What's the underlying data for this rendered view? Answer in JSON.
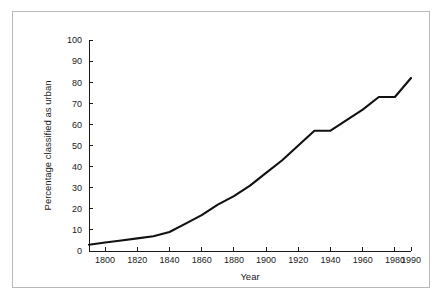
{
  "figure": {
    "frame_color": "#b9b9b9",
    "background": "#ffffff"
  },
  "chart_data": {
    "type": "line",
    "title": "",
    "xlabel": "Year",
    "ylabel": "Percentage classified as urban",
    "xlim": [
      1790,
      1990
    ],
    "ylim": [
      0,
      100
    ],
    "grid": false,
    "legend": null,
    "line_color": "#111111",
    "xticks": [
      1800,
      1820,
      1840,
      1860,
      1880,
      1900,
      1920,
      1940,
      1960,
      1980,
      1990
    ],
    "xtick_labels": [
      "1800",
      "1820",
      "1840",
      "1860",
      "1880",
      "1900",
      "1920",
      "1940",
      "1960",
      "1980",
      "1990"
    ],
    "yticks": [
      0,
      10,
      20,
      30,
      40,
      50,
      60,
      70,
      80,
      90,
      100
    ],
    "ytick_labels": [
      "0",
      "10",
      "20",
      "30",
      "40",
      "50",
      "60",
      "70",
      "80",
      "90",
      "100"
    ],
    "series": [
      {
        "name": "Percentage classified as urban",
        "x": [
          1790,
          1800,
          1810,
          1820,
          1830,
          1840,
          1850,
          1860,
          1870,
          1880,
          1890,
          1900,
          1910,
          1920,
          1930,
          1940,
          1950,
          1960,
          1970,
          1980,
          1990
        ],
        "values": [
          3,
          4,
          5,
          6,
          7,
          9,
          13,
          17,
          22,
          26,
          31,
          37,
          43,
          50,
          57,
          57,
          62,
          67,
          73,
          73,
          82
        ]
      }
    ]
  },
  "caption": {
    "sliver_text": ""
  }
}
